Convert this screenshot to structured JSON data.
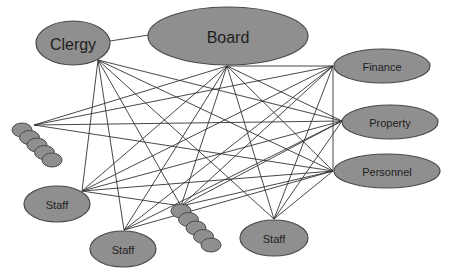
{
  "diagram": {
    "nodes": [
      {
        "id": "clergy",
        "label": "Clergy",
        "cx": 73,
        "cy": 43,
        "rx": 37,
        "ry": 22,
        "font": 16,
        "anchor": [
          98,
          60
        ]
      },
      {
        "id": "board",
        "label": "Board",
        "cx": 228,
        "cy": 36,
        "rx": 80,
        "ry": 29,
        "font": 16,
        "anchor": [
          227,
          66
        ]
      },
      {
        "id": "finance",
        "label": "Finance",
        "cx": 382,
        "cy": 66,
        "rx": 48,
        "ry": 17,
        "font": 11,
        "anchor": [
          333,
          66
        ]
      },
      {
        "id": "property",
        "label": "Property",
        "cx": 390,
        "cy": 122,
        "rx": 48,
        "ry": 17,
        "font": 11,
        "anchor": [
          342,
          121
        ]
      },
      {
        "id": "personnel",
        "label": "Personnel",
        "cx": 387,
        "cy": 171,
        "rx": 53,
        "ry": 17,
        "font": 11,
        "anchor": [
          333,
          171
        ]
      },
      {
        "id": "staff-left",
        "label": "Staff",
        "cx": 57,
        "cy": 204,
        "rx": 33,
        "ry": 18,
        "font": 11,
        "anchor": [
          82,
          191
        ]
      },
      {
        "id": "staff-middle",
        "label": "Staff",
        "cx": 123,
        "cy": 249,
        "rx": 33,
        "ry": 18,
        "font": 11,
        "anchor": [
          124,
          230
        ]
      },
      {
        "id": "staff-right",
        "label": "Staff",
        "cx": 274,
        "cy": 238,
        "rx": 34,
        "ry": 18,
        "font": 11,
        "anchor": [
          274,
          219
        ]
      }
    ],
    "stacks": [
      {
        "id": "stack-left",
        "start": [
          22,
          130
        ],
        "step": [
          7.5,
          7.5
        ],
        "count": 5,
        "rx": 10,
        "ry": 7,
        "anchor": [
          34,
          125
        ]
      },
      {
        "id": "stack-middle",
        "start": [
          181,
          211
        ],
        "step": [
          7.5,
          8.5
        ],
        "count": 5,
        "rx": 10,
        "ry": 7,
        "anchor": [
          181,
          206
        ]
      }
    ],
    "edges": [
      [
        "clergy",
        "board"
      ],
      [
        "clergy",
        "staff-left"
      ],
      [
        "clergy",
        "staff-middle"
      ],
      [
        "clergy",
        "stack-middle"
      ],
      [
        "clergy",
        "staff-right"
      ],
      [
        "clergy",
        "property"
      ],
      [
        "clergy",
        "personnel"
      ],
      [
        "board",
        "stack-left"
      ],
      [
        "board",
        "staff-left"
      ],
      [
        "board",
        "staff-middle"
      ],
      [
        "board",
        "stack-middle"
      ],
      [
        "board",
        "staff-right"
      ],
      [
        "board",
        "finance"
      ],
      [
        "board",
        "property"
      ],
      [
        "board",
        "personnel"
      ],
      [
        "finance",
        "stack-left"
      ],
      [
        "finance",
        "staff-left"
      ],
      [
        "finance",
        "staff-middle"
      ],
      [
        "finance",
        "stack-middle"
      ],
      [
        "finance",
        "staff-right"
      ],
      [
        "finance",
        "personnel"
      ],
      [
        "property",
        "stack-left"
      ],
      [
        "property",
        "staff-left"
      ],
      [
        "property",
        "staff-middle"
      ],
      [
        "property",
        "stack-middle"
      ],
      [
        "property",
        "staff-right"
      ],
      [
        "personnel",
        "staff-left"
      ],
      [
        "personnel",
        "staff-middle"
      ],
      [
        "personnel",
        "stack-middle"
      ],
      [
        "personnel",
        "staff-right"
      ],
      [
        "personnel",
        "stack-left"
      ],
      [
        "staff-left",
        "stack-middle"
      ]
    ]
  }
}
